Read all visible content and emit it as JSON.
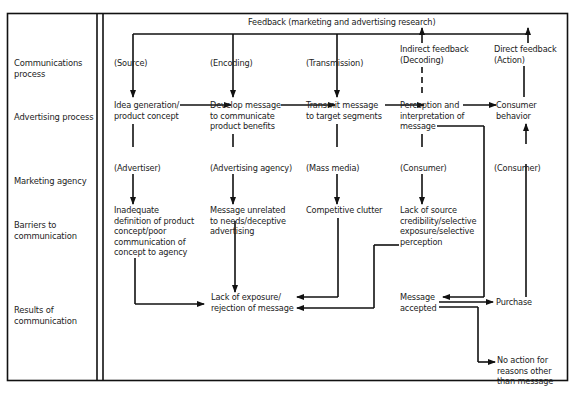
{
  "title": "Feedback (marketing and advertising research)",
  "row_labels": [
    "Communications\nprocess",
    "Advertising process",
    "Marketing agency",
    "Barriers to\ncommunication",
    "Results of\ncommunication"
  ],
  "communications": {
    "source": "(Source)",
    "encoding": "(Encoding)",
    "transmission": "(Transmission)",
    "indirect": "Indirect feedback\n(Decoding)",
    "direct": "Direct feedback\n(Action)"
  },
  "advertising": {
    "idea": "Idea generation/\nproduct concept",
    "develop": "Develop message\nto communicate\nproduct benefits",
    "transmit": "Transmit message\nto target segments",
    "perception": "Perception and\ninterpretation of\nmessage",
    "behavior": "Consumer\nbehavior"
  },
  "agency": {
    "advertiser": "(Advertiser)",
    "ad_agency": "(Advertising agency)",
    "mass_media": "(Mass media)",
    "consumer1": "(Consumer)",
    "consumer2": "(Consumer)"
  },
  "barriers": {
    "inadequate": "Inadequate\ndefinition of product\nconcept/poor\ncommunication of\nconcept to agency",
    "unrelated": "Message unrelated\nto needs/deceptive\nadvertising",
    "clutter": "Competitive clutter",
    "credibility": "Lack of source\ncredibility/selective\nexposure/selective\nperception"
  },
  "results": {
    "lack": "Lack of exposure/\nrejection of message",
    "accepted": "Message\naccepted",
    "purchase": "Purchase",
    "no_action": "No action for\nreasons other\nthan message"
  }
}
